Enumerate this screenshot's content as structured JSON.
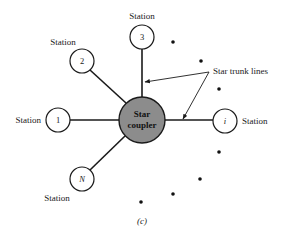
{
  "diagram": {
    "caption": "(c)",
    "hub": {
      "label_line1": "Star",
      "label_line2": "coupler",
      "fill": "#8c8c8c"
    },
    "stations": [
      {
        "id": "1",
        "label": "Station",
        "italic": false
      },
      {
        "id": "2",
        "label": "Station",
        "italic": false
      },
      {
        "id": "3",
        "label": "Station",
        "italic": false
      },
      {
        "id": "i",
        "label": "Station",
        "italic": true
      },
      {
        "id": "N",
        "label": "Station",
        "italic": true
      }
    ],
    "annotation": {
      "label": "Star trunk lines"
    },
    "ellipsis_dots_count": 7
  }
}
